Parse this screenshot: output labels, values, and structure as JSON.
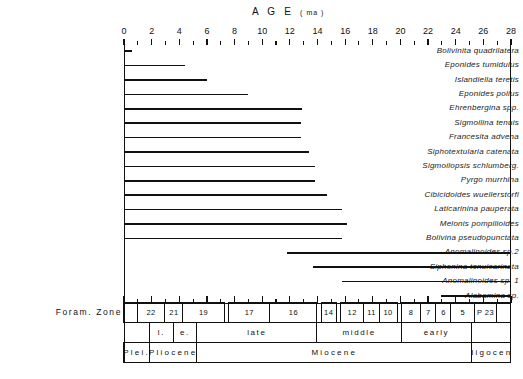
{
  "chart_data": {
    "type": "bar",
    "title": "A G E",
    "title_unit": "( ma )",
    "xlabel": "AGE (ma)",
    "ylabel": "",
    "orientation": "horizontal",
    "xlim": [
      0,
      28
    ],
    "xtick_step": 2,
    "xtick_minor_step": 1,
    "grid": false,
    "legend": false,
    "xticks": [
      0,
      2,
      4,
      6,
      8,
      10,
      12,
      14,
      16,
      18,
      20,
      22,
      24,
      26,
      28
    ],
    "xticklabels": [
      "0",
      "2",
      "4",
      "6",
      "8",
      "10",
      "12",
      "14",
      "16",
      "18",
      "20",
      "22",
      "24",
      "26",
      "28"
    ],
    "categories": [
      "Bolivinita quadrilatera",
      "Eponides tumidulus",
      "Islandiella teretis",
      "Eponides polius",
      "Ehrenbergina spp.",
      "Sigmoilina tenuis",
      "Francesita advena",
      "Siphotextularia catenata",
      "Sigmoilopsis schlumberg.",
      "Pyrgo murrhina",
      "Cibicidoides wuellerstorfi",
      "Laticarinina pauperata",
      "Melonis pompilioides",
      "Bolivina pseudopunctata",
      "Anomalinoides sp.2",
      "Siphonina tenuicarinata",
      "Anomalinoides sp. 1",
      "Alabamina sp."
    ],
    "ranges": [
      {
        "taxon": "Bolivinita quadrilatera",
        "start": 0.0,
        "end": 0.6
      },
      {
        "taxon": "Eponides tumidulus",
        "start": 0.0,
        "end": 4.4
      },
      {
        "taxon": "Islandiella teretis",
        "start": 0.0,
        "end": 6.0
      },
      {
        "taxon": "Eponides polius",
        "start": 0.0,
        "end": 9.0
      },
      {
        "taxon": "Ehrenbergina spp.",
        "start": 0.0,
        "end": 12.9
      },
      {
        "taxon": "Sigmoilina tenuis",
        "start": 0.0,
        "end": 12.8
      },
      {
        "taxon": "Francesita advena",
        "start": 0.0,
        "end": 12.8
      },
      {
        "taxon": "Siphotextularia catenata",
        "start": 0.0,
        "end": 13.4
      },
      {
        "taxon": "Sigmoilopsis schlumberg.",
        "start": 0.0,
        "end": 13.8
      },
      {
        "taxon": "Pyrgo murrhina",
        "start": 0.0,
        "end": 13.8
      },
      {
        "taxon": "Cibicidoides wuellerstorfi",
        "start": 0.0,
        "end": 14.7
      },
      {
        "taxon": "Laticarinina pauperata",
        "start": 0.0,
        "end": 15.8
      },
      {
        "taxon": "Melonis pompilioides",
        "start": 0.0,
        "end": 16.1
      },
      {
        "taxon": "Bolivina pseudopunctata",
        "start": 0.0,
        "end": 15.8
      },
      {
        "taxon": "Anomalinoides sp.2",
        "start": 11.8,
        "end": 28.0
      },
      {
        "taxon": "Siphonina tenuicarinata",
        "start": 13.7,
        "end": 28.0
      },
      {
        "taxon": "Anomalinoides sp. 1",
        "start": 15.8,
        "end": 28.0
      },
      {
        "taxon": "Alabamina sp.",
        "start": 22.9,
        "end": 28.0
      }
    ],
    "axes_caption": "Foram. Zone",
    "stratigraphy": {
      "foram_zones": [
        {
          "label": "",
          "start": 0.0,
          "end": 1.0
        },
        {
          "label": "22",
          "start": 1.0,
          "end": 3.0
        },
        {
          "label": "21",
          "start": 3.0,
          "end": 4.3
        },
        {
          "label": "19",
          "start": 4.3,
          "end": 7.3
        },
        {
          "label": "17",
          "start": 7.6,
          "end": 10.6
        },
        {
          "label": "16",
          "start": 10.6,
          "end": 14.0
        },
        {
          "label": "14",
          "start": 14.3,
          "end": 15.4
        },
        {
          "label": "12",
          "start": 15.7,
          "end": 17.4
        },
        {
          "label": "11",
          "start": 17.4,
          "end": 18.5
        },
        {
          "label": "10",
          "start": 18.5,
          "end": 19.8
        },
        {
          "label": "8",
          "start": 20.1,
          "end": 21.5
        },
        {
          "label": "7",
          "start": 21.5,
          "end": 22.6
        },
        {
          "label": "6",
          "start": 22.6,
          "end": 23.7
        },
        {
          "label": "5",
          "start": 23.7,
          "end": 25.4
        },
        {
          "label": "P 23",
          "start": 25.4,
          "end": 27.0
        },
        {
          "label": "",
          "start": 27.0,
          "end": 28.0
        }
      ],
      "sub_epochs": [
        {
          "label": "l.",
          "start": 1.9,
          "end": 3.6
        },
        {
          "label": "e.",
          "start": 3.6,
          "end": 5.3
        },
        {
          "label": "late",
          "start": 5.3,
          "end": 14.0
        },
        {
          "label": "middle",
          "start": 14.0,
          "end": 20.1
        },
        {
          "label": "early",
          "start": 20.1,
          "end": 25.2
        }
      ],
      "epochs": [
        {
          "label": "Plei.",
          "start": 0.0,
          "end": 1.9
        },
        {
          "label": "Pliocene",
          "start": 1.9,
          "end": 5.3
        },
        {
          "label": "Miocene",
          "start": 5.3,
          "end": 25.2
        },
        {
          "label": "Oligocene",
          "start": 25.2,
          "end": 28.0
        }
      ]
    },
    "colors": {
      "line": "#111111",
      "background": "#ffffff",
      "text": "#1a1a1a"
    }
  }
}
